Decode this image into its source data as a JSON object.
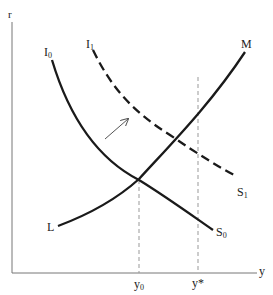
{
  "diagram": {
    "type": "IS-LM style diagram",
    "axes": {
      "y_axis_label": "r",
      "x_axis_label": "y"
    },
    "curves": [
      {
        "name": "I0-S0",
        "start_label": "I",
        "start_sub": "0",
        "end_label": "S",
        "end_sub": "0",
        "style": "solid"
      },
      {
        "name": "I1-S1",
        "start_label": "I",
        "start_sub": "1",
        "end_label": "S",
        "end_sub": "1",
        "style": "dashed"
      },
      {
        "name": "L-M",
        "start_label": "L",
        "end_label": "M",
        "style": "solid"
      }
    ],
    "x_ticks": [
      {
        "label": "y",
        "sub": "0"
      },
      {
        "label": "y*",
        "sub": ""
      }
    ],
    "shift_arrow": "rightward shift from I0-S0 to I1-S1",
    "colors": {
      "curve": "#1a1a1a",
      "axis": "#777777",
      "guide": "#999999"
    }
  }
}
